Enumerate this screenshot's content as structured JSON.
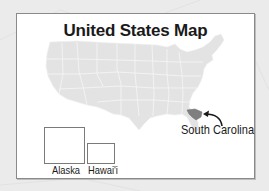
{
  "title": "United States Map",
  "highlight": {
    "state": "South Carolina",
    "color": "#7f7f7f"
  },
  "insets": [
    {
      "label": "Alaska"
    },
    {
      "label": "Hawai'i"
    }
  ],
  "colors": {
    "background": "#ebebeb",
    "frame": "#ffffff",
    "frame_border": "#8a8a8a",
    "land": "#e3e3e3",
    "state_borders": "#f7f7f7",
    "highlight": "#7f7f7f",
    "text": "#1a1a1a"
  }
}
